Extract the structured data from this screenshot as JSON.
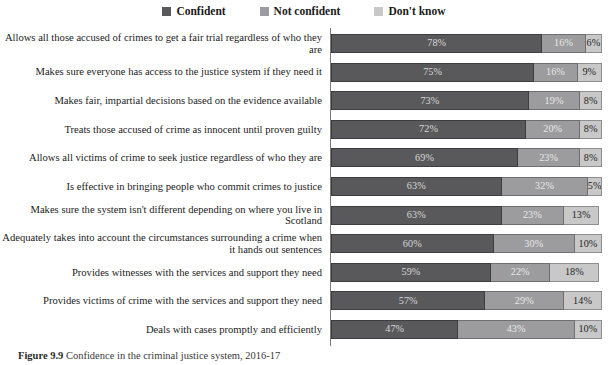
{
  "legend": {
    "items": [
      {
        "label": "Confident",
        "color": "#59595b",
        "icon": "legend-swatch-icon"
      },
      {
        "label": "Not confident",
        "color": "#9c9c9e",
        "icon": "legend-swatch-icon"
      },
      {
        "label": "Don't know",
        "color": "#c8c8c9",
        "icon": "legend-swatch-icon"
      }
    ]
  },
  "caption": {
    "prefix": "Figure 9.9",
    "text": "Confidence in the criminal justice system, 2016-17"
  },
  "chart_data": {
    "type": "bar",
    "orientation": "horizontal",
    "stacked": true,
    "title": "",
    "subtitle": "",
    "xlabel": "",
    "ylabel": "",
    "xlim": [
      0,
      100
    ],
    "grid": false,
    "legend_position": "top-center",
    "value_suffix": "%",
    "categories": [
      "Allows all those accused of crimes to get a fair trial regardless of who they are",
      "Makes sure everyone has access to the justice system if they need it",
      "Makes fair, impartial decisions based on the evidence available",
      "Treats those accused of crime as innocent until proven guilty",
      "Allows all victims of crime to seek justice regardless of who they are",
      "Is effective in bringing people who commit crimes to justice",
      "Makes sure the system isn't different depending on where you live in Scotland",
      "Adequately takes into account the circumstances surrounding a crime when it hands out sentences",
      "Provides witnesses with the services and support they need",
      "Provides victims of crime with the services and support they need",
      "Deals with cases promptly and efficiently"
    ],
    "series": [
      {
        "name": "Confident",
        "color": "#59595b",
        "values": [
          78,
          75,
          73,
          72,
          69,
          63,
          63,
          60,
          59,
          57,
          47
        ],
        "labels": [
          "78%",
          "75%",
          "73%",
          "72%",
          "69%",
          "63%",
          "63%",
          "60%",
          "59%",
          "57%",
          "47%"
        ]
      },
      {
        "name": "Not confident",
        "color": "#9c9c9e",
        "values": [
          16,
          16,
          19,
          20,
          23,
          32,
          23,
          30,
          22,
          29,
          43
        ],
        "labels": [
          "16%",
          "16%",
          "19%",
          "20%",
          "23%",
          "32%",
          "23%",
          "30%",
          "22%",
          "29%",
          "43%"
        ]
      },
      {
        "name": "Don't know",
        "color": "#c8c8c9",
        "values": [
          6,
          9,
          8,
          8,
          8,
          5,
          13,
          10,
          18,
          14,
          10
        ],
        "labels": [
          "6%",
          "9%",
          "8%",
          "8%",
          "8%",
          "5%",
          "13%",
          "10%",
          "18%",
          "14%",
          "10%"
        ]
      }
    ]
  }
}
